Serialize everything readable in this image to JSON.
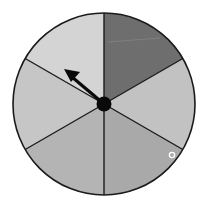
{
  "spinner": {
    "sections": 6,
    "center": [
      104,
      104
    ],
    "radius": 91,
    "sectors": [
      {
        "name": "top-right",
        "color": "#6e6e6e",
        "start_deg": -90,
        "end_deg": -30
      },
      {
        "name": "right",
        "color": "#c2c2c2",
        "start_deg": -30,
        "end_deg": 30
      },
      {
        "name": "bottom-right",
        "color": "#a9a9a9",
        "start_deg": 30,
        "end_deg": 90
      },
      {
        "name": "bottom-left",
        "color": "#b4b4b4",
        "start_deg": 90,
        "end_deg": 150
      },
      {
        "name": "left",
        "color": "#c6c6c6",
        "start_deg": 150,
        "end_deg": 210
      },
      {
        "name": "top-left",
        "color": "#d4d4d4",
        "start_deg": 210,
        "end_deg": 270
      }
    ],
    "arrow": {
      "direction": "upper-left",
      "tip": [
        64,
        69
      ]
    },
    "marker": {
      "label": "small-circle",
      "position": [
        172,
        155
      ]
    }
  }
}
